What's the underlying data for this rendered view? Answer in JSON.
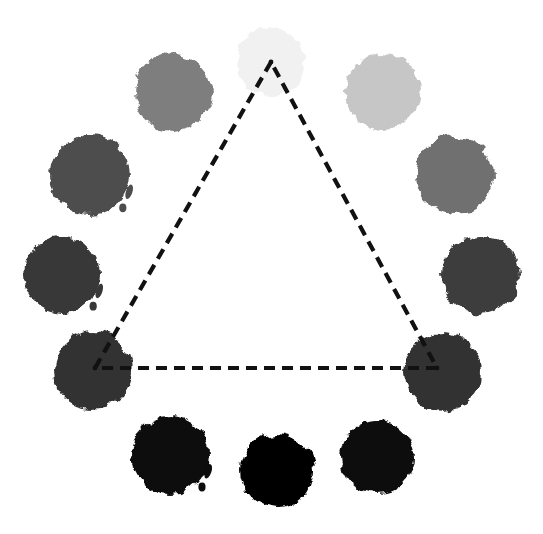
{
  "figure": {
    "background_color": "#ffffff",
    "width": 543,
    "height": 534
  },
  "chart_data": {
    "type": "scatter",
    "xlabel": "",
    "ylabel": "",
    "xlim": [
      0,
      543
    ],
    "ylim": [
      0,
      534
    ],
    "grid": false,
    "legend": null,
    "series": [
      {
        "name": "ink-blots",
        "points": [
          {
            "id": "blot-top",
            "label": "top",
            "x": 271,
            "y": 62,
            "r": 34,
            "color": "#f1f1f1",
            "gray_value": 241,
            "ring_index": 0,
            "angle_deg": 90,
            "is_triangle_vertex": true
          },
          {
            "id": "blot-upper-left",
            "label": "upper-left",
            "x": 173,
            "y": 92,
            "r": 38,
            "color": "#7e7e7e",
            "gray_value": 126,
            "ring_index": 1,
            "angle_deg": 123,
            "is_triangle_vertex": false
          },
          {
            "id": "blot-upper-right",
            "label": "upper-right",
            "x": 383,
            "y": 92,
            "r": 38,
            "color": "#c6c6c6",
            "gray_value": 198,
            "ring_index": 10,
            "angle_deg": 57,
            "is_triangle_vertex": false
          },
          {
            "id": "blot-left-upper",
            "label": "left-upper",
            "x": 90,
            "y": 175,
            "r": 40,
            "color": "#4d4d4d",
            "gray_value": 77,
            "ring_index": 2,
            "angle_deg": 155,
            "is_triangle_vertex": false
          },
          {
            "id": "blot-right-upper",
            "label": "right-upper",
            "x": 455,
            "y": 175,
            "r": 39,
            "color": "#6f6f6f",
            "gray_value": 111,
            "ring_index": 9,
            "angle_deg": 25,
            "is_triangle_vertex": false
          },
          {
            "id": "blot-left-middle",
            "label": "left-middle",
            "x": 62,
            "y": 275,
            "r": 38,
            "color": "#383838",
            "gray_value": 56,
            "ring_index": 3,
            "angle_deg": 188,
            "is_triangle_vertex": false
          },
          {
            "id": "blot-right-middle",
            "label": "right-middle",
            "x": 480,
            "y": 275,
            "r": 39,
            "color": "#3d3d3d",
            "gray_value": 61,
            "ring_index": 8,
            "angle_deg": 352,
            "is_triangle_vertex": false
          },
          {
            "id": "blot-bottom-left",
            "label": "bottom-left",
            "x": 93,
            "y": 370,
            "r": 39,
            "color": "#303030",
            "gray_value": 48,
            "ring_index": 4,
            "angle_deg": 215,
            "is_triangle_vertex": true
          },
          {
            "id": "blot-bottom-right",
            "label": "bottom-right",
            "x": 443,
            "y": 372,
            "r": 39,
            "color": "#323232",
            "gray_value": 50,
            "ring_index": 7,
            "angle_deg": 325,
            "is_triangle_vertex": true
          },
          {
            "id": "blot-lower-left",
            "label": "lower-left",
            "x": 170,
            "y": 455,
            "r": 39,
            "color": "#0c0c0c",
            "gray_value": 12,
            "ring_index": 5,
            "angle_deg": 245,
            "is_triangle_vertex": false
          },
          {
            "id": "blot-lower-center",
            "label": "lower-center",
            "x": 277,
            "y": 470,
            "r": 37,
            "color": "#000000",
            "gray_value": 0,
            "ring_index": 6,
            "angle_deg": 270,
            "is_triangle_vertex": false
          },
          {
            "id": "blot-lower-right",
            "label": "lower-right",
            "x": 377,
            "y": 457,
            "r": 37,
            "color": "#090909",
            "gray_value": 9,
            "ring_index": 11,
            "angle_deg": 295,
            "is_triangle_vertex": false
          }
        ]
      }
    ],
    "annotations": [
      {
        "id": "dashed-triangle",
        "type": "polygon",
        "style": "dashed",
        "stroke_color": "#111111",
        "stroke_width": 4.2,
        "dash_pattern": "11 7",
        "vertices": [
          {
            "label": "apex",
            "x": 271,
            "y": 62,
            "blot": "blot-top"
          },
          {
            "label": "bottom-left",
            "x": 95,
            "y": 368,
            "blot": "blot-bottom-left"
          },
          {
            "label": "bottom-right",
            "x": 437,
            "y": 368,
            "blot": "blot-bottom-right"
          }
        ]
      }
    ]
  }
}
